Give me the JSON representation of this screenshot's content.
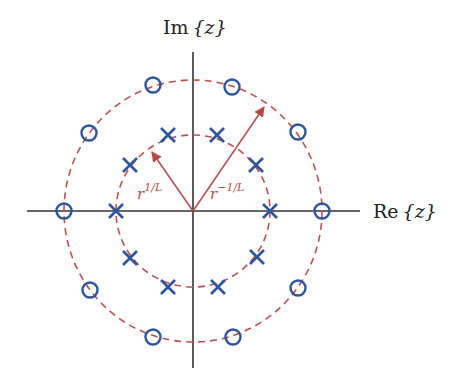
{
  "diagram": {
    "axes": {
      "real_label": "Re",
      "real_arg": "{z}",
      "imag_label": "Im",
      "imag_arg": "{z}",
      "color": "#333333"
    },
    "origin": [
      193,
      211
    ],
    "circles": {
      "outer": {
        "radius_x": 129,
        "radius_y": 131,
        "color": "#c0504d",
        "style": "dashed"
      },
      "inner": {
        "radius_x": 77,
        "radius_y": 76,
        "color": "#c0504d",
        "style": "dashed"
      }
    },
    "radius_arrows": [
      {
        "label_base": "r",
        "label_exp": "1/L",
        "circle": "inner",
        "from": [
          193,
          211
        ],
        "to": [
          152,
          152
        ]
      },
      {
        "label_base": "r",
        "label_exp": "−1/L",
        "circle": "outer",
        "from": [
          193,
          211
        ],
        "to": [
          264,
          107
        ]
      }
    ],
    "markers": {
      "color": "#2e56a0",
      "zeros_outer_circle": [
        [
          322,
          211
        ],
        [
          298,
          132
        ],
        [
          232,
          87
        ],
        [
          153,
          85
        ],
        [
          89,
          133
        ],
        [
          64,
          211
        ],
        [
          90,
          290
        ],
        [
          153,
          337
        ],
        [
          233,
          337
        ],
        [
          298,
          288
        ]
      ],
      "poles_inner_circle": [
        [
          270,
          211
        ],
        [
          256,
          165
        ],
        [
          217,
          135
        ],
        [
          168,
          135
        ],
        [
          130,
          165
        ],
        [
          116,
          211
        ],
        [
          130,
          258
        ],
        [
          168,
          287
        ],
        [
          218,
          287
        ],
        [
          257,
          257
        ]
      ]
    },
    "legend": {
      "zero_symbol": "circle",
      "pole_symbol": "cross"
    }
  }
}
